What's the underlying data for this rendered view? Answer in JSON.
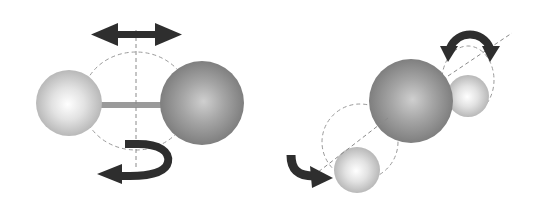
{
  "diagram": {
    "description": "Rotational and vibrational motions of molecules",
    "colors": {
      "background": "#ffffff",
      "light_atom_center": "#ffffff",
      "light_atom_edge": "#b4b4b4",
      "dark_atom_center": "#c8c8c8",
      "dark_atom_edge": "#7a7a7a",
      "bond": "#9a9a9a",
      "arrow": "#2e2e2e",
      "dashed_line": "#9a9a9a"
    },
    "left_molecule": {
      "name": "diatomic molecule",
      "atoms": [
        {
          "id": "small-atom",
          "type": "light",
          "cx": 69,
          "cy": 103,
          "r": 33
        },
        {
          "id": "large-atom",
          "type": "dark",
          "cx": 202,
          "cy": 103,
          "r": 42
        }
      ],
      "bond": {
        "x1": 100,
        "y1": 105,
        "x2": 162,
        "y2": 105
      },
      "rotation_axis": {
        "x1": 136,
        "y1": 28,
        "x2": 136,
        "y2": 170
      },
      "rotation_ellipse": {
        "cx": 136,
        "cy": 101,
        "rx": 54,
        "ry": 49
      },
      "motions": [
        "double-headed horizontal arrow (translation/vibration)",
        "curved rotation arrow about vertical axis"
      ]
    },
    "right_molecule": {
      "name": "triatomic molecule",
      "atoms": [
        {
          "id": "upper-small-atom",
          "type": "light",
          "cx": 468,
          "cy": 96,
          "r": 21
        },
        {
          "id": "center-large-atom",
          "type": "dark",
          "cx": 411,
          "cy": 101,
          "r": 42
        },
        {
          "id": "lower-small-atom",
          "type": "light",
          "cx": 357,
          "cy": 170,
          "r": 23
        }
      ],
      "axis": {
        "x1": 313,
        "y1": 176,
        "x2": 512,
        "y2": 33
      },
      "rotation_circles": [
        {
          "cx": 468,
          "cy": 80,
          "rx": 26,
          "ry": 33
        },
        {
          "cx": 360,
          "cy": 142,
          "rx": 38,
          "ry": 38
        }
      ],
      "motions": [
        "curved double-headed arrow (upper)",
        "curved arrow (lower left)"
      ]
    }
  }
}
